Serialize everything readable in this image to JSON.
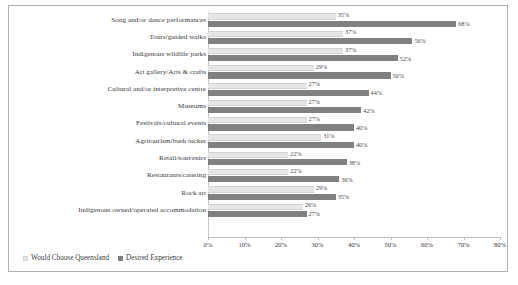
{
  "chart_data": {
    "type": "bar",
    "orientation": "horizontal",
    "title": "",
    "xlabel": "",
    "ylabel": "",
    "xlim": [
      0,
      80
    ],
    "xtick_labels": [
      "0%",
      "10%",
      "20%",
      "30%",
      "40%",
      "50%",
      "60%",
      "70%",
      "80%"
    ],
    "xticks": [
      0,
      10,
      20,
      30,
      40,
      50,
      60,
      70,
      80
    ],
    "grid": false,
    "legend_position": "bottom-left",
    "value_suffix": "%",
    "categories": [
      "Song and/or dance performances",
      "Tours/guided walks",
      "Indigenous wildlife parks",
      "Art gallery/Arts & crafts",
      "Cultural and/or interpretive centre",
      "Museums",
      "Festivals/cultural events",
      "Agritourism/bush tucker",
      "Retail/souvenirs",
      "Restaurants/catering",
      "Rock art",
      "Indigenous owned/operated accommodation"
    ],
    "series": [
      {
        "name": "Would Choose Queensland",
        "color": "#e6e6e6",
        "values": [
          35,
          37,
          37,
          29,
          27,
          27,
          27,
          31,
          22,
          22,
          29,
          26
        ],
        "labels": [
          "35%",
          "37%",
          "37%",
          "29%",
          "27%",
          "27%",
          "27%",
          "31%",
          "22%",
          "22%",
          "29%",
          "26%"
        ]
      },
      {
        "name": "Desired Experience",
        "color": "#808080",
        "values": [
          68,
          56,
          52,
          50,
          44,
          42,
          40,
          40,
          38,
          36,
          35,
          27
        ],
        "labels": [
          "68%",
          "56%",
          "52%",
          "50%",
          "44%",
          "42%",
          "40%",
          "40%",
          "38%",
          "36%",
          "35%",
          "27%"
        ]
      }
    ]
  },
  "legend": {
    "items": [
      {
        "label": "Would Choose Queensland",
        "color": "#e6e6e6"
      },
      {
        "label": "Desired Experience",
        "color": "#808080"
      }
    ]
  }
}
